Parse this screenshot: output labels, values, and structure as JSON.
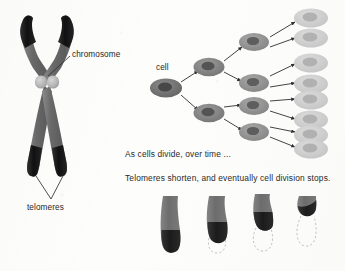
{
  "figure": {
    "title_visible": false,
    "background_color": "#fdfdfc",
    "panels": [
      "chromosome-diagram",
      "cell-division-tree",
      "telomere-shortening-series"
    ]
  },
  "labels": {
    "chromosome": "chromosome",
    "telomeres": "telomeres",
    "cell": "cell"
  },
  "captions": {
    "line1": "As cells divide, over time ...",
    "line2": "Telomeres shorten, and eventually cell division stops."
  },
  "colors": {
    "arm_gray": "#6e6e6e",
    "arm_gray_light": "#8a8a8a",
    "telomere_dark": "#1d1d1d",
    "centromere": "#b9b9b9",
    "cell_dark": "#6b6b6b",
    "cell_mid": "#8f8f8f",
    "cell_faded": "#cfcfcf",
    "nucleus_dark": "#4a4a4a",
    "arrow": "#3a3a3a",
    "dashed_outline": "#b5b5b5",
    "text": "#262626"
  },
  "chromosome_diagram": {
    "shape": "X-shaped metaphase chromosome",
    "arms": 4,
    "telomere_caps": 4,
    "telomere_cap_positions": [
      "top-left",
      "top-right",
      "bottom-left",
      "bottom-right"
    ],
    "centromere_count": 2,
    "leader_lines": [
      {
        "label": "chromosome",
        "from": [
          71,
          55
        ],
        "to": [
          47,
          77
        ]
      },
      {
        "label": "telomeres",
        "from": [
          52,
          200
        ],
        "to": [
          36,
          177
        ]
      },
      {
        "label": "telomeres",
        "from": [
          52,
          200
        ],
        "to": [
          62,
          177
        ]
      }
    ]
  },
  "cell_tree": {
    "generations": 4,
    "root_label": "cell",
    "nodes_per_generation": [
      1,
      2,
      4,
      8
    ],
    "branching_factor": 2,
    "shading_note": "cells become progressively lighter each generation, final generation is faded",
    "generation_fill": [
      "#6b6b6b",
      "#7e7e7e",
      "#8f8f8f",
      "#cfcfcf"
    ],
    "gen1": [
      {
        "cx": 166,
        "cy": 88
      }
    ],
    "gen2": [
      {
        "cx": 209,
        "cy": 67
      },
      {
        "cx": 209,
        "cy": 113
      }
    ],
    "gen3": [
      {
        "cx": 254,
        "cy": 42
      },
      {
        "cx": 254,
        "cy": 82
      },
      {
        "cx": 254,
        "cy": 106
      },
      {
        "cx": 254,
        "cy": 132
      }
    ],
    "gen4": [
      {
        "cx": 309,
        "cy": 18
      },
      {
        "cx": 309,
        "cy": 37
      },
      {
        "cx": 309,
        "cy": 62
      },
      {
        "cx": 309,
        "cy": 83
      },
      {
        "cx": 309,
        "cy": 100
      },
      {
        "cx": 309,
        "cy": 120
      },
      {
        "cx": 309,
        "cy": 134
      },
      {
        "cx": 309,
        "cy": 148
      }
    ]
  },
  "telomere_series": {
    "count": 4,
    "description": "chromosome arm tip shown at four successive divisions; solid length shrinks while dashed outline marks original length",
    "items": [
      {
        "index": 1,
        "solid_height": 58,
        "telomere_cap": "large",
        "dashed_outline": false
      },
      {
        "index": 2,
        "solid_height": 50,
        "telomere_cap": "medium",
        "dashed_outline": true
      },
      {
        "index": 3,
        "solid_height": 40,
        "telomere_cap": "small",
        "dashed_outline": true
      },
      {
        "index": 4,
        "solid_height": 22,
        "telomere_cap": "tiny",
        "dashed_outline": true
      }
    ]
  }
}
